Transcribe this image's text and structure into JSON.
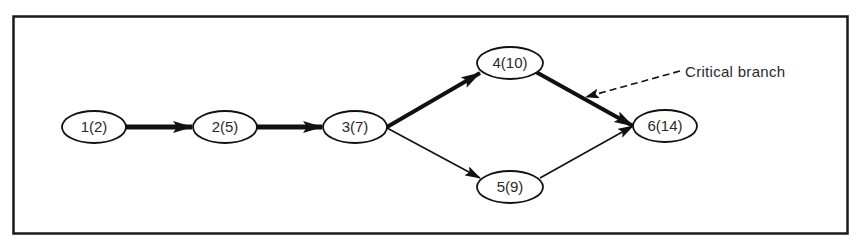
{
  "diagram": {
    "type": "network-critical-path",
    "frame": {
      "x": 13,
      "y": 16,
      "width": 835,
      "height": 218
    },
    "colors": {
      "stroke": "#1a1a1a",
      "text": "#2a2a2a",
      "background": "#ffffff"
    },
    "nodes": [
      {
        "id": "1",
        "label": "1(2)",
        "cx": 94,
        "cy": 127
      },
      {
        "id": "2",
        "label": "2(5)",
        "cx": 225,
        "cy": 127
      },
      {
        "id": "3",
        "label": "3(7)",
        "cx": 355,
        "cy": 127
      },
      {
        "id": "4",
        "label": "4(10)",
        "cx": 510,
        "cy": 63
      },
      {
        "id": "5",
        "label": "5(9)",
        "cx": 510,
        "cy": 187
      },
      {
        "id": "6",
        "label": "6(14)",
        "cx": 665,
        "cy": 126
      }
    ],
    "edges": [
      {
        "from": "1",
        "to": "2",
        "critical": true
      },
      {
        "from": "2",
        "to": "3",
        "critical": true
      },
      {
        "from": "3",
        "to": "4",
        "critical": true
      },
      {
        "from": "3",
        "to": "5",
        "critical": false
      },
      {
        "from": "4",
        "to": "6",
        "critical": true
      },
      {
        "from": "5",
        "to": "6",
        "critical": false
      }
    ],
    "annotation": {
      "label": "Critical branch",
      "points_to_edge": "4-6"
    }
  }
}
